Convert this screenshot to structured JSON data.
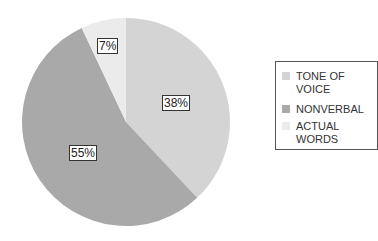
{
  "chart_data": {
    "type": "pie",
    "title": "",
    "categories": [
      "TONE OF VOICE",
      "NONVERBAL",
      "ACTUAL WORDS"
    ],
    "values": [
      38,
      55,
      7
    ],
    "data_labels": [
      "38%",
      "55%",
      "7%"
    ],
    "colors": [
      "#d4d4d4",
      "#a9a9a9",
      "#ebebeb"
    ],
    "legend_position": "right"
  },
  "legend": {
    "items": [
      {
        "label": "TONE OF\nVOICE",
        "color": "#d4d4d4"
      },
      {
        "label": "NONVERBAL",
        "color": "#a9a9a9"
      },
      {
        "label": "ACTUAL\nWORDS",
        "color": "#ebebeb"
      }
    ]
  },
  "labels": {
    "tone": "38%",
    "nonverbal": "55%",
    "actual": "7%"
  }
}
